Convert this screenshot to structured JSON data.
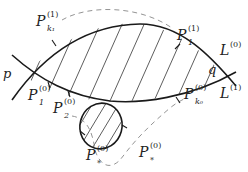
{
  "diagram": {
    "colors": {
      "curve": "#1a1a1a",
      "hatch": "#333333",
      "dashed": "#888888",
      "text": "#222222"
    },
    "points": {
      "p": "p",
      "q": "q"
    },
    "labels": {
      "pk1": {
        "base": "P",
        "sub": "k₁",
        "sup": "(1)"
      },
      "p1_1": {
        "base": "P",
        "sub": "1",
        "sup": "(1)"
      },
      "p1_0": {
        "base": "P",
        "sub": "1",
        "sup": "(0)"
      },
      "p2_0": {
        "base": "P",
        "sub": "2",
        "sup": "(0)"
      },
      "pk0": {
        "base": "P",
        "sub": "k₀",
        "sup": "(0)"
      },
      "pstar_left": {
        "base": "P",
        "sub": "*",
        "sup": "(0)"
      },
      "pstar_right": {
        "base": "P",
        "sub": "*",
        "sup": "(0)"
      },
      "L0": {
        "base": "L",
        "sup": "(0)"
      },
      "L1": {
        "base": "L",
        "sup": "(1)"
      }
    }
  }
}
